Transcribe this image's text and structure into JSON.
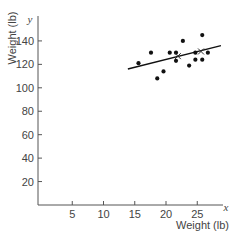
{
  "chart_data": {
    "type": "scatter",
    "title": "",
    "xlabel": "Weight (lb)",
    "ylabel": "Weight (lb)",
    "x_axis_var": "x",
    "y_axis_var": "y",
    "xlim": [
      0,
      29
    ],
    "ylim": [
      0,
      155
    ],
    "xticks": [
      5,
      10,
      15,
      20,
      25
    ],
    "yticks": [
      20,
      40,
      60,
      80,
      100,
      120,
      140
    ],
    "grid": false,
    "legend": null,
    "series": [
      {
        "name": "observations",
        "marker": "dot",
        "points": [
          {
            "x": 15.6,
            "y": 121
          },
          {
            "x": 17.6,
            "y": 130
          },
          {
            "x": 18.6,
            "y": 108
          },
          {
            "x": 19.6,
            "y": 114
          },
          {
            "x": 20.6,
            "y": 130
          },
          {
            "x": 21.6,
            "y": 130
          },
          {
            "x": 21.6,
            "y": 123
          },
          {
            "x": 22.7,
            "y": 140
          },
          {
            "x": 23.7,
            "y": 119
          },
          {
            "x": 24.7,
            "y": 130
          },
          {
            "x": 24.7,
            "y": 124
          },
          {
            "x": 25.8,
            "y": 145
          },
          {
            "x": 25.8,
            "y": 124
          },
          {
            "x": 26.7,
            "y": 130
          }
        ]
      },
      {
        "name": "marked points",
        "marker": "x",
        "points": [
          {
            "x": 21.9,
            "y": 127
          },
          {
            "x": 25.6,
            "y": 131
          }
        ]
      }
    ],
    "fit_line": {
      "x1": 13.9,
      "y1": 116,
      "x2": 28.8,
      "y2": 136
    }
  }
}
